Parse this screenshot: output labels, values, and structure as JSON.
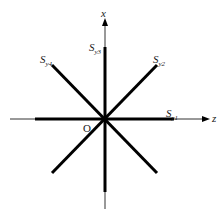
{
  "diagram": {
    "title": "",
    "axes": {
      "vertical": {
        "label": "x",
        "direction": "up"
      },
      "horizontal": {
        "label": "z",
        "direction": "right"
      },
      "origin_label": "O"
    },
    "sources": [
      {
        "id": "Sy1",
        "main": "S",
        "sub": "y1",
        "orientation": "horizontal (along z)"
      },
      {
        "id": "Sy2",
        "main": "S",
        "sub": "y2",
        "orientation": "diagonal +45°"
      },
      {
        "id": "Sy3",
        "main": "S",
        "sub": "y3",
        "orientation": "vertical (along x)"
      },
      {
        "id": "Sy4",
        "main": "S",
        "sub": "y4",
        "orientation": "diagonal -45°"
      }
    ],
    "colors": {
      "line": "#000000",
      "thin_axis": "#333333",
      "text": "#1a1a1a",
      "background": "#ffffff"
    }
  }
}
